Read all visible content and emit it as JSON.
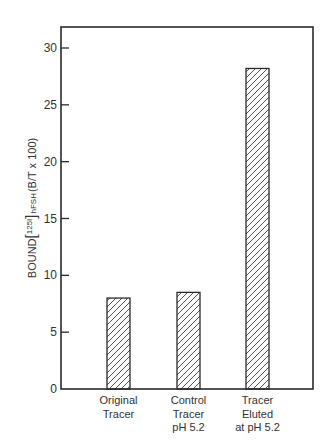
{
  "chart_data": {
    "type": "bar",
    "title": "",
    "xlabel": "",
    "ylabel": "BOUND [125I] hFSH (B/T x 100)",
    "ylabel_parts": {
      "prefix": "BOUND",
      "bracket_open": "[",
      "isotope_mass": "125",
      "isotope_symbol": "I",
      "bracket_close": "]",
      "analyte": "hFSH",
      "units": "(B/T x 100)"
    },
    "categories": [
      [
        "Original",
        "Tracer"
      ],
      [
        "Control",
        "Tracer",
        "pH 5.2"
      ],
      [
        "Tracer",
        "Eluted",
        "at pH 5.2"
      ]
    ],
    "category_labels_flat": [
      "Original Tracer",
      "Control Tracer pH 5.2",
      "Tracer Eluted at pH 5.2"
    ],
    "values": [
      8.0,
      8.5,
      28.2
    ],
    "ylim": [
      0,
      31.5
    ],
    "yticks": [
      0,
      5,
      10,
      15,
      20,
      25,
      30
    ],
    "grid": false,
    "legend": null,
    "bar_fill": "diagonal-hatch",
    "colors": {
      "axis": "#2a2a2a",
      "bar_stroke": "#2a2a2a",
      "hatch": "#444444",
      "background": "#ffffff"
    }
  }
}
